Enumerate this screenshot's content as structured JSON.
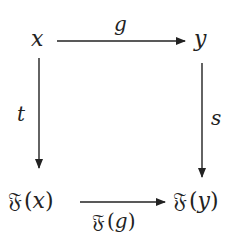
{
  "diagram": {
    "type": "commutative-square",
    "nodes": {
      "top_left": {
        "label": "x"
      },
      "top_right": {
        "label": "y"
      },
      "bottom_left": {
        "functor": "𝔉",
        "arg": "x"
      },
      "bottom_right": {
        "functor": "𝔉",
        "arg": "y"
      }
    },
    "arrows": {
      "top": {
        "from": "x",
        "to": "y",
        "label": "g"
      },
      "left": {
        "from": "x",
        "to": "𝔉(x)",
        "label": "t"
      },
      "right": {
        "from": "y",
        "to": "𝔉(y)",
        "label": "s"
      },
      "bottom": {
        "from": "𝔉(x)",
        "to": "𝔉(y)",
        "functor": "𝔉",
        "arg": "g"
      }
    },
    "colors": {
      "ink": "#222222",
      "background": "#ffffff"
    },
    "punct": {
      "open": "(",
      "close": ")"
    }
  }
}
